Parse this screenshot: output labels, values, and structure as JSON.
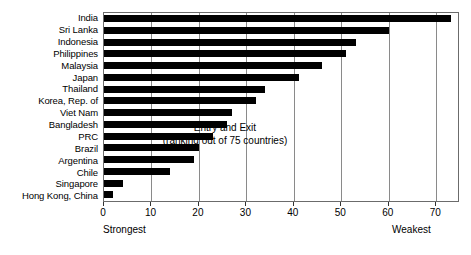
{
  "chart_data": {
    "type": "bar",
    "orientation": "horizontal",
    "title": "",
    "annotation_line1": "Entry and Exit",
    "annotation_line2": "(ranking out of 75 countries)",
    "xlabel": "",
    "ylabel": "",
    "xlim": [
      0,
      75
    ],
    "ylim": null,
    "grid": true,
    "legend": null,
    "xticks": [
      0,
      10,
      20,
      30,
      40,
      50,
      60,
      70
    ],
    "xticklabels": [
      "0",
      "10",
      "20",
      "30",
      "40",
      "50",
      "60",
      "70"
    ],
    "axis_end_labels": {
      "left": "Strongest",
      "right": "Weakest"
    },
    "bar_color": "#000000",
    "categories": [
      "India",
      "Sri Lanka",
      "Indonesia",
      "Philippines",
      "Malaysia",
      "Japan",
      "Thailand",
      "Korea, Rep. of",
      "Viet Nam",
      "Bangladesh",
      "PRC",
      "Brazil",
      "Argentina",
      "Chile",
      "Singapore",
      "Hong Kong, China"
    ],
    "values": [
      73,
      60,
      53,
      51,
      46,
      41,
      34,
      32,
      27,
      26,
      23,
      20,
      19,
      14,
      4,
      2
    ]
  }
}
